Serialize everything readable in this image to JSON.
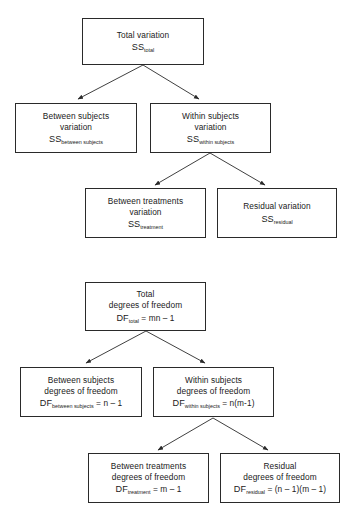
{
  "diagram": {
    "type": "flowchart",
    "title": "",
    "panels": [
      {
        "id": "sum-of-squares",
        "name": "Partition of sums of squares",
        "nodes": [
          {
            "id": "ss-total",
            "lines": [
              "Total variation"
            ],
            "symbol": "SS",
            "subscript": "total",
            "equation": ""
          },
          {
            "id": "ss-between-subjects",
            "lines": [
              "Between subjects",
              "variation"
            ],
            "symbol": "SS",
            "subscript": "between subjects",
            "equation": ""
          },
          {
            "id": "ss-within-subjects",
            "lines": [
              "Within subjects",
              "variation"
            ],
            "symbol": "SS",
            "subscript": "within subjects",
            "equation": ""
          },
          {
            "id": "ss-treatment",
            "lines": [
              "Between treatments",
              "variation"
            ],
            "symbol": "SS",
            "subscript": "treatment",
            "equation": ""
          },
          {
            "id": "ss-residual",
            "lines": [
              "Residual variation"
            ],
            "symbol": "SS",
            "subscript": "residual",
            "equation": ""
          }
        ]
      },
      {
        "id": "degrees-of-freedom",
        "name": "Partition of degrees of freedom",
        "nodes": [
          {
            "id": "df-total",
            "lines": [
              "Total",
              "degrees of freedom"
            ],
            "symbol": "DF",
            "subscript": "total",
            "equation": " = mn – 1"
          },
          {
            "id": "df-between-subjects",
            "lines": [
              "Between subjects",
              "degrees of freedom"
            ],
            "symbol": "DF",
            "subscript": "between subjects",
            "equation": " = n – 1"
          },
          {
            "id": "df-within-subjects",
            "lines": [
              "Within subjects",
              "degrees of freedom"
            ],
            "symbol": "DF",
            "subscript": "within subjects",
            "equation": " = n(m-1)"
          },
          {
            "id": "df-treatment",
            "lines": [
              "Between treatments",
              "degrees of freedom"
            ],
            "symbol": "DF",
            "subscript": "treatment",
            "equation": " = m – 1"
          },
          {
            "id": "df-residual",
            "lines": [
              "Residual",
              "degrees of freedom"
            ],
            "symbol": "DF",
            "subscript": "residual",
            "equation": " = (n – 1)(m – 1)"
          }
        ]
      }
    ],
    "colors": {
      "stroke": "#2a2a2a",
      "text": "#1a1a1a",
      "background": "#ffffff"
    }
  }
}
